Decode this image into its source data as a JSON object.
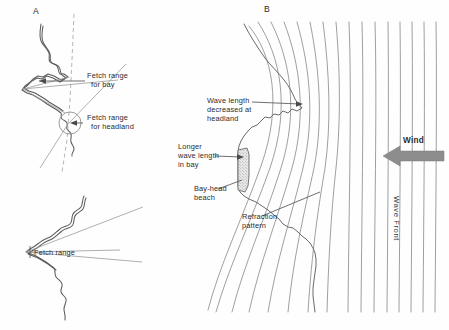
{
  "figure": {
    "background_color": "#fefefe",
    "ink_color": "#5a5a5a",
    "wave_line_color": "#8e8e8e",
    "accent_color": "#8d8d8d"
  },
  "panels": [
    {
      "letter": "A",
      "name": "fetch-range-panel",
      "description": "Irregular crenulate coastline in plan view with fetch range angles drawn for a bay and for a headland"
    },
    {
      "letter": "B",
      "name": "wave-refraction-panel",
      "description": "Wave crests approaching an embayed coast, refracting and converging on headlands while diverging in the bay"
    }
  ],
  "labels": {
    "fetch_bay": {
      "line1": "Fetch range",
      "line2": "for bay"
    },
    "fetch_headland": {
      "line1": "Fetch range",
      "line2": "for headland"
    },
    "fetch_lower": {
      "line1": "Fetch range"
    },
    "wave_length_headland": {
      "line1": "Wave length",
      "line2": "decreased at",
      "line3": "headland"
    },
    "longer_wave_length_bay": {
      "line1": "Longer",
      "line2": "wave length",
      "line3": "in bay"
    },
    "bay_head_beach": {
      "line1": "Bay-head",
      "line2": "beach"
    },
    "refraction_pattern": {
      "line1": "Refraction",
      "line2": "pattern"
    },
    "wind": "Wind",
    "wave_front": "Wave Front"
  }
}
